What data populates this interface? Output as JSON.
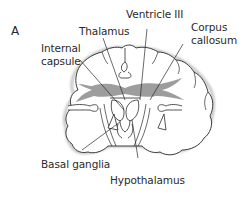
{
  "figure": {
    "panel_label": "A",
    "labels": {
      "ventricle": "Ventricle III",
      "thalamus": "Thalamus",
      "internal_capsule_line1": "Internal",
      "internal_capsule_line2": "capsule",
      "corpus_line1": "Corpus",
      "corpus_line2": "callosum",
      "basal_ganglia": "Basal ganglia",
      "hypothalamus": "Hypothalamus"
    },
    "colors": {
      "outline": "#2a2a2a",
      "shadow": "#b8b8b8",
      "tract_fill": "#8c8c8c",
      "background": "#ffffff"
    }
  }
}
